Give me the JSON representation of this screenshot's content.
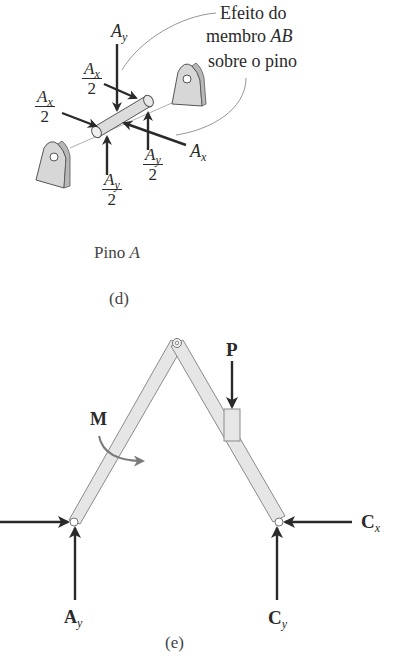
{
  "panel_d": {
    "annotation": {
      "line1": "Efeito do",
      "line2_prefix": "membro ",
      "line2_var": "AB",
      "line3": "sobre o pino"
    },
    "forces": {
      "Ay_top": {
        "base": "A",
        "sub": "y"
      },
      "Ax_half_upper": {
        "base": "A",
        "sub": "x",
        "den": "2"
      },
      "Ax_half_left": {
        "base": "A",
        "sub": "x",
        "den": "2"
      },
      "Ay_half_right": {
        "base": "A",
        "sub": "y",
        "den": "2"
      },
      "Ay_half_bottom": {
        "base": "A",
        "sub": "y",
        "den": "2"
      },
      "Ax_right": {
        "base": "A",
        "sub": "x"
      }
    },
    "title_prefix": "Pino ",
    "title_var": "A",
    "caption": "(d)"
  },
  "panel_e": {
    "labels": {
      "P": "P",
      "M": "M",
      "Ay": {
        "base": "A",
        "sub": "y"
      },
      "Cx": {
        "base": "C",
        "sub": "x"
      },
      "Cy": {
        "base": "C",
        "sub": "y"
      }
    },
    "caption": "(e)"
  },
  "colors": {
    "ink": "#2a2a2a",
    "member_fill": "#e6e6e6",
    "member_stroke": "#8a8a8a",
    "moment_arrow": "#7a7a7a"
  }
}
